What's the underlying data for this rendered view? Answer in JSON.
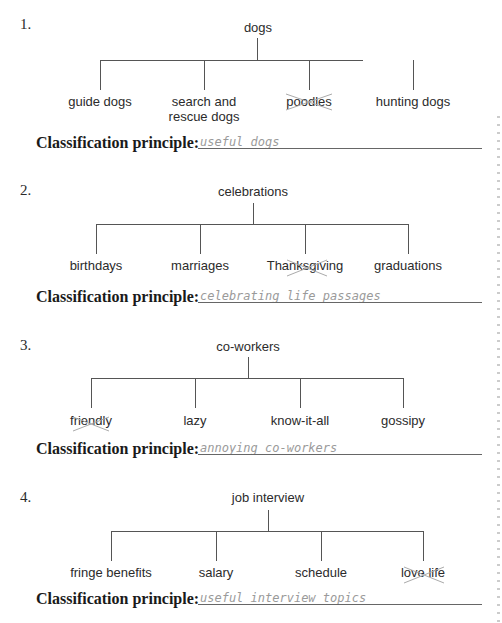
{
  "exercises": [
    {
      "number": "1.",
      "root": "dogs",
      "children": [
        "guide dogs",
        "search and\nrescue dogs",
        "poodles",
        "hunting dogs"
      ],
      "crossed_out": "poodles",
      "label": "Classification principle:",
      "answer": "useful dogs"
    },
    {
      "number": "2.",
      "root": "celebrations",
      "children": [
        "birthdays",
        "marriages",
        "Thanksgiving",
        "graduations"
      ],
      "crossed_out": "Thanksgiving",
      "label": "Classification principle:",
      "answer": "celebrating life passages"
    },
    {
      "number": "3.",
      "root": "co-workers",
      "children": [
        "friendly",
        "lazy",
        "know-it-all",
        "gossipy"
      ],
      "crossed_out": "friendly",
      "label": "Classification principle:",
      "answer": "annoying co-workers"
    },
    {
      "number": "4.",
      "root": "job interview",
      "children": [
        "fringe benefits",
        "salary",
        "schedule",
        "love life"
      ],
      "crossed_out": "love life",
      "label": "Classification principle:",
      "answer": "useful interview topics"
    }
  ]
}
